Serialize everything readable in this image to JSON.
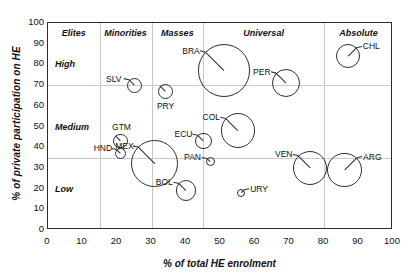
{
  "chart_data": {
    "type": "scatter",
    "title": "",
    "xlabel": "% of total HE enrolment",
    "ylabel": "% of private participation on HE",
    "xlim": [
      0,
      100
    ],
    "ylim": [
      0,
      100
    ],
    "xticks": [
      0,
      10,
      20,
      30,
      40,
      50,
      60,
      70,
      80,
      90,
      100
    ],
    "yticks": [
      0,
      10,
      20,
      30,
      40,
      50,
      60,
      70,
      80,
      90,
      100
    ],
    "grid": "partial",
    "legend": "none",
    "bubble_marker": "open circle with radius line",
    "gridlines": {
      "vertical_x": [
        15,
        30,
        45,
        80
      ],
      "horizontal_y": [
        35,
        70
      ]
    },
    "x_bands": [
      {
        "label": "Elites",
        "from": 0,
        "to": 15
      },
      {
        "label": "Minorities",
        "from": 15,
        "to": 30
      },
      {
        "label": "Masses",
        "from": 30,
        "to": 45
      },
      {
        "label": "Universal",
        "from": 45,
        "to": 80
      },
      {
        "label": "Absolute",
        "from": 80,
        "to": 100
      }
    ],
    "y_zones": [
      {
        "label": "High",
        "from": 70,
        "to": 100
      },
      {
        "label": "Medium",
        "from": 35,
        "to": 70
      },
      {
        "label": "Low",
        "from": 0,
        "to": 35
      }
    ],
    "points": [
      {
        "name": "SLV",
        "x": 25,
        "y": 70,
        "r": 2.2,
        "label_side": "left"
      },
      {
        "name": "PRY",
        "x": 34,
        "y": 67,
        "r": 2.2,
        "label_side": "below"
      },
      {
        "name": "BRA",
        "x": 51,
        "y": 77,
        "r": 7.6,
        "label_side": "left"
      },
      {
        "name": "PER",
        "x": 69,
        "y": 71,
        "r": 4.1,
        "label_side": "left"
      },
      {
        "name": "CHL",
        "x": 87,
        "y": 84,
        "r": 3.5,
        "label_side": "right"
      },
      {
        "name": "GTM",
        "x": 21,
        "y": 43,
        "r": 2.1,
        "label_side": "above"
      },
      {
        "name": "HND",
        "x": 21,
        "y": 37,
        "r": 1.6,
        "label_side": "left"
      },
      {
        "name": "MEX",
        "x": 31,
        "y": 32,
        "r": 6.8,
        "label_side": "left"
      },
      {
        "name": "ECU",
        "x": 45,
        "y": 43,
        "r": 2.4,
        "label_side": "left"
      },
      {
        "name": "COL",
        "x": 55,
        "y": 48,
        "r": 5.0,
        "label_side": "left"
      },
      {
        "name": "PAN",
        "x": 47,
        "y": 33,
        "r": 1.3,
        "label_side": "left"
      },
      {
        "name": "BOL",
        "x": 40,
        "y": 19,
        "r": 3.0,
        "label_side": "left"
      },
      {
        "name": "URY",
        "x": 56,
        "y": 18,
        "r": 1.2,
        "label_side": "right"
      },
      {
        "name": "VEN",
        "x": 76,
        "y": 30,
        "r": 5.0,
        "label_side": "left"
      },
      {
        "name": "ARG",
        "x": 86,
        "y": 29,
        "r": 5.0,
        "label_side": "right"
      }
    ]
  }
}
